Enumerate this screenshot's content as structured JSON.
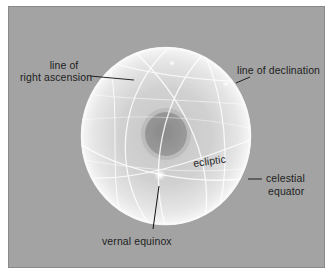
{
  "figure": {
    "background_color": "#a3a3a3",
    "sphere_color": "#eeeeee",
    "earth_color": "#8f8f8f",
    "labels": {
      "right_ascension": {
        "line1": "line of",
        "line2": "right ascension"
      },
      "declination": "line of declination",
      "ecliptic": "ecliptic",
      "celestial_equator": {
        "line1": "celestial",
        "line2": "equator"
      },
      "vernal_equinox": "vernal equinox"
    }
  }
}
